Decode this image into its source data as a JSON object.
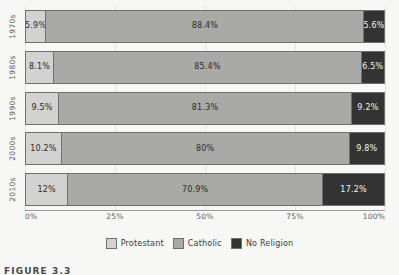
{
  "chart_data": {
    "type": "bar",
    "orientation": "horizontal",
    "stacked": true,
    "stack_total": 100,
    "title": "",
    "xlabel": "",
    "ylabel": "",
    "xlim": [
      0,
      100
    ],
    "grid": true,
    "legend_position": "bottom-center",
    "categories": [
      "1970s",
      "1980s",
      "1990s",
      "2000s",
      "2010s"
    ],
    "xticks": [
      "0%",
      "25%",
      "50%",
      "75%",
      "100%"
    ],
    "xtick_values": [
      0,
      25,
      50,
      75,
      100
    ],
    "series": [
      {
        "name": "Protestant",
        "color": "#d2d2d0",
        "values": [
          5.9,
          8.1,
          9.5,
          10.2,
          12
        ],
        "labels": [
          "5.9%",
          "8.1%",
          "9.5%",
          "10.2%",
          "12%"
        ]
      },
      {
        "name": "Catholic",
        "color": "#a9a9a7",
        "values": [
          88.4,
          85.4,
          81.3,
          80,
          70.9
        ],
        "labels": [
          "88.4%",
          "85.4%",
          "81.3%",
          "80%",
          "70.9%"
        ]
      },
      {
        "name": "No Religion",
        "color": "#333333",
        "values": [
          5.6,
          6.5,
          9.2,
          9.8,
          17.2
        ],
        "labels": [
          "5.6%",
          "6.5%",
          "9.2%",
          "9.8%",
          "17.2%"
        ]
      }
    ]
  },
  "legend": {
    "items": [
      {
        "label": "Protestant"
      },
      {
        "label": "Catholic"
      },
      {
        "label": "No Religion"
      }
    ]
  },
  "caption": {
    "text": "FIGURE 3.3"
  }
}
